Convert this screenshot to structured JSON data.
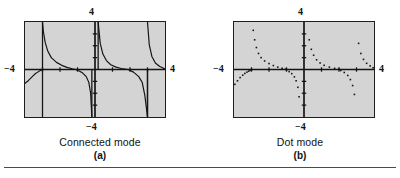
{
  "figure": {
    "panels": [
      {
        "id": "a",
        "tag": "(a)",
        "mode_caption": "Connected mode",
        "axis_labels": {
          "top": "4",
          "bottom": "−4",
          "left": "−4",
          "right": "4"
        }
      },
      {
        "id": "b",
        "tag": "(b)",
        "mode_caption": "Dot mode",
        "axis_labels": {
          "top": "4",
          "bottom": "−4",
          "left": "−4",
          "right": "4"
        }
      }
    ]
  },
  "colors": {
    "screen_background": "#d4d4d4",
    "screen_border": "#1e1e1e",
    "plot_ink": "#141414",
    "page_background": "#ffffff",
    "rule": "#4a4a56"
  },
  "chart_data": [
    {
      "type": "line",
      "title": "Connected mode",
      "subtitle": "(a)",
      "xlabel": "",
      "ylabel": "",
      "xlim": [
        -4,
        4
      ],
      "ylim": [
        -4,
        4
      ],
      "grid": false,
      "legend": null,
      "axis_ticks": {
        "x": [
          -3,
          -2,
          -1,
          0,
          1,
          2,
          3
        ],
        "y": [
          -3,
          -2,
          -1,
          0,
          1,
          2,
          3
        ]
      },
      "tick_labels": {
        "x_min": "−4",
        "x_max": "4",
        "y_min": "−4",
        "y_max": "4"
      },
      "annotations": [
        "Vertical pseudo-asymptote segments drawn where the calculator connects points across breaks",
        "Branches resemble y = tan(x) over [-4, 4]"
      ],
      "series": [
        {
          "name": "branch-left-lower",
          "x": [
            -4.0,
            -3.8,
            -3.6,
            -3.4,
            -3.25,
            -3.15,
            -3.08,
            -3.02,
            -3.0
          ],
          "y": [
            -1.16,
            -0.92,
            -0.62,
            -0.34,
            -0.2,
            -0.11,
            -0.06,
            -0.02,
            0.0
          ]
        },
        {
          "name": "branch-mid-left",
          "x": [
            -3.0,
            -2.95,
            -2.85,
            -2.7,
            -2.5,
            -2.2,
            -1.9,
            -1.6,
            -1.3,
            -1.1
          ],
          "y": [
            4.0,
            3.2,
            2.3,
            1.55,
            1.0,
            0.6,
            0.35,
            0.18,
            0.06,
            0.0
          ]
        },
        {
          "name": "branch-mid-left-lower",
          "x": [
            -1.1,
            -0.9,
            -0.7,
            -0.5,
            -0.35,
            -0.25,
            -0.18
          ],
          "y": [
            0.0,
            -0.12,
            -0.3,
            -0.6,
            -1.1,
            -2.0,
            -4.0
          ]
        },
        {
          "name": "branch-center",
          "x": [
            0.18,
            0.3,
            0.45,
            0.65,
            0.9,
            1.2,
            1.5,
            1.9
          ],
          "y": [
            4.0,
            2.2,
            1.3,
            0.75,
            0.4,
            0.2,
            0.08,
            0.0
          ]
        },
        {
          "name": "branch-center-lower",
          "x": [
            1.9,
            2.2,
            2.5,
            2.7,
            2.85,
            2.95,
            3.0
          ],
          "y": [
            0.0,
            -0.22,
            -0.6,
            -1.1,
            -2.2,
            -3.4,
            -4.0
          ]
        },
        {
          "name": "branch-right",
          "x": [
            3.0,
            3.1,
            3.25,
            3.45,
            3.7,
            4.0
          ],
          "y": [
            4.0,
            2.1,
            1.1,
            0.55,
            0.25,
            0.05
          ]
        }
      ]
    },
    {
      "type": "scatter",
      "title": "Dot mode",
      "subtitle": "(b)",
      "xlabel": "",
      "ylabel": "",
      "xlim": [
        -4,
        4
      ],
      "ylim": [
        -4,
        4
      ],
      "grid": false,
      "legend": null,
      "axis_ticks": {
        "x": [
          -3,
          -2,
          -1,
          0,
          1,
          2,
          3
        ],
        "y": [
          -3,
          -2,
          -1,
          0,
          1,
          2,
          3
        ]
      },
      "tick_labels": {
        "x_min": "−4",
        "x_max": "4",
        "y_min": "−4",
        "y_max": "4"
      },
      "annotations": [
        "Same function plotted as unconnected points so no false vertical asymptote lines appear"
      ],
      "series": [
        {
          "name": "branch-left-lower",
          "x": [
            -3.95,
            -3.8,
            -3.65,
            -3.5,
            -3.38,
            -3.26,
            -3.16,
            -3.08,
            -3.0
          ],
          "y": [
            -1.25,
            -0.95,
            -0.68,
            -0.48,
            -0.33,
            -0.22,
            -0.14,
            -0.07,
            -0.02
          ]
        },
        {
          "name": "branch-mid-left",
          "x": [
            -2.9,
            -2.82,
            -2.72,
            -2.6,
            -2.45,
            -2.25,
            -2.0,
            -1.75,
            -1.5,
            -1.25,
            -1.05
          ],
          "y": [
            3.3,
            2.5,
            1.85,
            1.35,
            1.0,
            0.72,
            0.5,
            0.33,
            0.2,
            0.1,
            0.03
          ]
        },
        {
          "name": "branch-mid-left-lower",
          "x": [
            -1.0,
            -0.85,
            -0.7,
            -0.55,
            -0.45,
            -0.35,
            -0.28
          ],
          "y": [
            -0.05,
            -0.18,
            -0.35,
            -0.62,
            -0.95,
            -1.5,
            -2.3
          ]
        },
        {
          "name": "branch-center",
          "x": [
            0.3,
            0.42,
            0.55,
            0.72,
            0.92,
            1.15,
            1.45,
            1.75,
            2.0
          ],
          "y": [
            2.5,
            1.7,
            1.2,
            0.82,
            0.55,
            0.35,
            0.2,
            0.1,
            0.04
          ]
        },
        {
          "name": "branch-center-lower",
          "x": [
            2.1,
            2.3,
            2.5,
            2.65,
            2.78,
            2.88
          ],
          "y": [
            -0.08,
            -0.25,
            -0.5,
            -0.85,
            -1.35,
            -2.1
          ]
        },
        {
          "name": "branch-right",
          "x": [
            3.12,
            3.25,
            3.4,
            3.58,
            3.78,
            3.95
          ],
          "y": [
            2.2,
            1.35,
            0.85,
            0.52,
            0.3,
            0.15
          ]
        }
      ]
    }
  ]
}
